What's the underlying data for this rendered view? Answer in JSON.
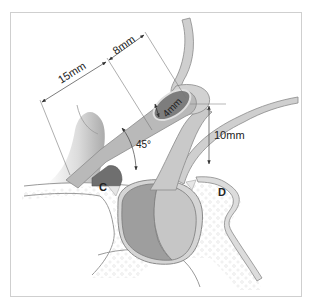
{
  "diagram": {
    "measurements": {
      "length_15mm": "15mm",
      "length_8mm": "8mm",
      "diameter_4mm": "4mm",
      "height_10mm": "10mm",
      "angle_45": "45°"
    },
    "labels": {
      "c": "C",
      "d": "D"
    },
    "colors": {
      "background": "#ffffff",
      "frame": "#c8c8c8",
      "tube_light": "#c4c4c4",
      "tube_mid": "#a8a8a8",
      "tube_dark": "#7d7d7d",
      "bulb_dark": "#9a9a9a",
      "bulb_light": "#c9c9c9",
      "bone_fill": "#f3f3f3",
      "outline": "#8a8a8a",
      "dimension_line": "#555555"
    }
  }
}
